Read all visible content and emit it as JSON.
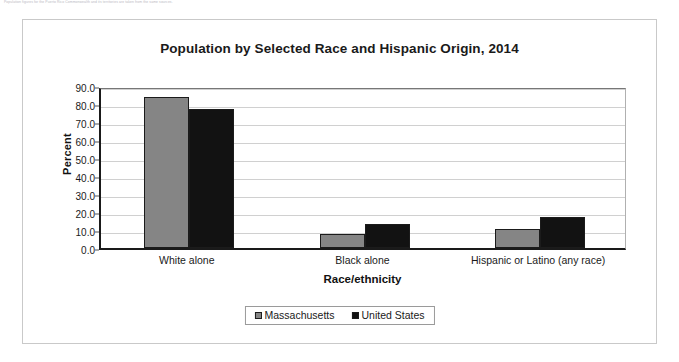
{
  "footnote": "Population figures for the Puerto Rico Commonwealth and its territories are taken from the same sources.",
  "chart_data": {
    "type": "bar",
    "title": "Population by Selected Race and Hispanic Origin, 2014",
    "xlabel": "Race/ethnicity",
    "ylabel": "Percent",
    "ylim": [
      0,
      90
    ],
    "ytick_step": 10,
    "ytick_labels": [
      "0.0",
      "10.0",
      "20.0",
      "30.0",
      "40.0",
      "50.0",
      "60.0",
      "70.0",
      "80.0",
      "90.0"
    ],
    "categories": [
      "White alone",
      "Black alone",
      "Hispanic or Latino (any race)"
    ],
    "grid": true,
    "legend_position": "bottom",
    "series": [
      {
        "name": "Massachusetts",
        "color": "#858585",
        "values": [
          84.0,
          8.0,
          10.5
        ]
      },
      {
        "name": "United States",
        "color": "#121212",
        "values": [
          77.4,
          13.2,
          17.4
        ]
      }
    ]
  }
}
